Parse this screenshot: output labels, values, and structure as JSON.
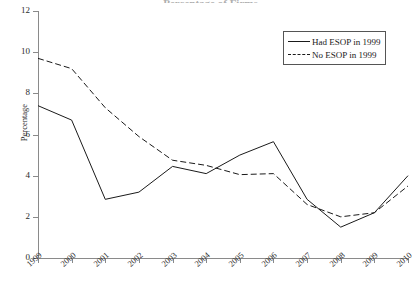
{
  "chart_data": {
    "type": "line",
    "title": "",
    "xlabel": "",
    "ylabel": "Percentage",
    "ylim": [
      0,
      12
    ],
    "yticks": [
      0,
      2,
      4,
      6,
      8,
      10,
      12
    ],
    "grid": false,
    "legend_position": "top-right",
    "categories": [
      "1999",
      "2000",
      "2001",
      "2002",
      "2003",
      "2004",
      "2005",
      "2006",
      "2007",
      "2008",
      "2009",
      "2010"
    ],
    "series": [
      {
        "name": "Had ESOP in 1999",
        "style": "solid",
        "color": "#1a1a1a",
        "values": [
          7.4,
          6.7,
          2.85,
          3.2,
          4.45,
          4.1,
          5.0,
          5.65,
          2.85,
          1.5,
          2.2,
          4.0
        ]
      },
      {
        "name": "No ESOP in 1999",
        "style": "dashed",
        "color": "#1a1a1a",
        "values": [
          9.7,
          9.2,
          7.3,
          5.9,
          4.75,
          4.5,
          4.05,
          4.1,
          2.6,
          2.0,
          2.2,
          3.5
        ]
      }
    ]
  },
  "axes": {
    "y_label": "Percentage",
    "y_tick_labels": [
      "0",
      "2",
      "4",
      "6",
      "8",
      "10",
      "12"
    ],
    "x_tick_labels": [
      "1999",
      "2000",
      "2001",
      "2002",
      "2003",
      "2004",
      "2005",
      "2006",
      "2007",
      "2008",
      "2009",
      "2010"
    ]
  },
  "legend": {
    "items": [
      {
        "label": "Had ESOP in 1999",
        "style": "solid"
      },
      {
        "label": "No ESOP in 1999",
        "style": "dashed"
      }
    ]
  },
  "title_sliver": {
    "text": "Percentage of Firms"
  }
}
